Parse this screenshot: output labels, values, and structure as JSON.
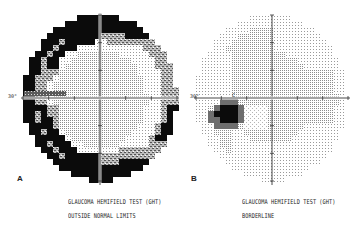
{
  "figure": {
    "panels": [
      {
        "id": "A",
        "letter": "A",
        "caption_line1": "GLAUCOMA HEMIFIELD TEST (GHT)",
        "caption_line2": "OUTSIDE NORMAL LIMITS",
        "axis_label": "30°",
        "center": [
          100,
          98
        ],
        "radius_x": 77,
        "radius_y": 83
      },
      {
        "id": "B",
        "letter": "B",
        "caption_line1": "GLAUCOMA HEMIFIELD TEST (GHT)",
        "caption_line2": "BORDERLINE",
        "axis_label": "30°",
        "marker_label": "C",
        "center": [
          272,
          98
        ],
        "radius_x": 76,
        "radius_y": 83
      }
    ],
    "legend_grayscale": {
      "level0_normal": "#ffffff",
      "level1_light_dots": "#e2e2e2",
      "level2_medium": "#c6c6c6",
      "level3_dark_pattern": "#8a8a8a",
      "level4_dark_gray": "#5a5a5a",
      "level5_black": "#0a0a0a"
    }
  }
}
